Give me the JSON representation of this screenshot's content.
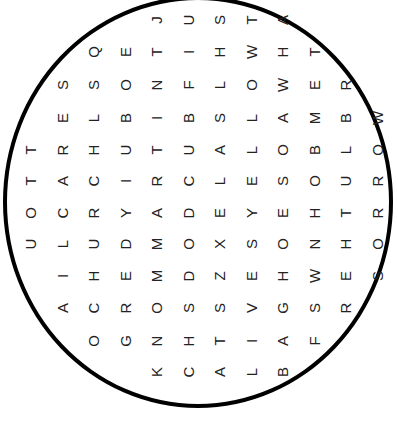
{
  "puzzle": {
    "type": "word-search",
    "shape": "circle",
    "letter_rotation_deg": -90,
    "colors": {
      "border": "#000000",
      "letters": "#222222",
      "background": "#ffffff"
    },
    "rows": [
      {
        "start_col": 4,
        "letters": "JUSTA"
      },
      {
        "start_col": 2,
        "letters": "QETIHWHT"
      },
      {
        "start_col": 1,
        "letters": "SSONFLOWER"
      },
      {
        "start_col": 1,
        "letters": "ELBIBSLAMBW"
      },
      {
        "start_col": 0,
        "letters": "TRHUTUALOBLO"
      },
      {
        "start_col": 0,
        "letters": "TACIRCLESOUR"
      },
      {
        "start_col": 0,
        "letters": "OCRYADEYEHTR"
      },
      {
        "start_col": 0,
        "letters": "ULUDMOXSONHO"
      },
      {
        "start_col": 1,
        "letters": "IHEMDZEHWES"
      },
      {
        "start_col": 1,
        "letters": "ACROSSVGSR"
      },
      {
        "start_col": 2,
        "letters": "OGNHTIAF"
      },
      {
        "start_col": 4,
        "letters": "KCALB"
      }
    ]
  }
}
